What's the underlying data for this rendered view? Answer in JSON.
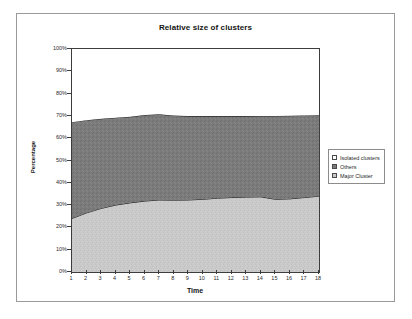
{
  "chart_data": {
    "type": "area",
    "stacked": true,
    "percent_stacked": true,
    "title": "Relative size of clusters",
    "xlabel": "Time",
    "ylabel": "Percentage",
    "grid": false,
    "legend_position": "right",
    "xlim": [
      1,
      18
    ],
    "ylim": [
      0,
      100
    ],
    "x": [
      1,
      2,
      3,
      4,
      5,
      6,
      7,
      8,
      9,
      10,
      11,
      12,
      13,
      14,
      15,
      16,
      17,
      18
    ],
    "categories": [
      "1",
      "2",
      "3",
      "4",
      "5",
      "6",
      "7",
      "8",
      "9",
      "10",
      "11",
      "12",
      "13",
      "14",
      "15",
      "16",
      "17",
      "18"
    ],
    "xtick_labels": [
      "1",
      "2",
      "3",
      "4",
      "5",
      "6",
      "7",
      "8",
      "9",
      "10",
      "11",
      "12",
      "13",
      "14",
      "15",
      "16",
      "17",
      "18"
    ],
    "ytick_labels": [
      "0%",
      "10%",
      "20%",
      "30%",
      "40%",
      "50%",
      "60%",
      "70%",
      "80%",
      "90%",
      "100%"
    ],
    "ytick_values": [
      0,
      10,
      20,
      30,
      40,
      50,
      60,
      70,
      80,
      90,
      100
    ],
    "series": [
      {
        "name": "Major Cluster",
        "color": "#c9c9c9",
        "stack_order": 1,
        "values": [
          24,
          26.5,
          28.5,
          30,
          31,
          31.8,
          32.3,
          32.2,
          32.3,
          32.6,
          33.1,
          33.4,
          33.6,
          33.7,
          32.6,
          32.8,
          33.4,
          34.0
        ]
      },
      {
        "name": "Others",
        "color": "#7b7b7b",
        "stack_order": 2,
        "values": [
          43.2,
          41.6,
          40.2,
          39.2,
          38.6,
          38.6,
          38.4,
          38.0,
          37.6,
          37.3,
          36.8,
          36.5,
          36.3,
          36.3,
          37.4,
          37.3,
          36.8,
          36.3
        ]
      },
      {
        "name": "Isolated clusters",
        "color": "#ffffff",
        "stack_order": 3,
        "values": [
          32.8,
          31.9,
          31.3,
          30.8,
          30.4,
          29.6,
          29.3,
          29.8,
          30.1,
          30.1,
          30.1,
          30.1,
          30.1,
          30.0,
          30.0,
          29.9,
          29.8,
          29.7
        ]
      }
    ],
    "cumulative_boundaries": {
      "major_cluster_top": [
        24,
        26.5,
        28.5,
        30,
        31,
        31.8,
        32.3,
        32.2,
        32.3,
        32.6,
        33.1,
        33.4,
        33.6,
        33.7,
        32.6,
        32.8,
        33.4,
        34.0
      ],
      "others_top": [
        67.2,
        68.1,
        68.7,
        69.2,
        69.6,
        70.4,
        70.7,
        70.2,
        69.9,
        69.9,
        69.9,
        69.9,
        69.9,
        70.0,
        70.0,
        70.1,
        70.2,
        70.3
      ]
    }
  },
  "legend": {
    "items": [
      {
        "label": "Isolated clusters",
        "color": "#ffffff"
      },
      {
        "label": "Others",
        "color": "#7b7b7b"
      },
      {
        "label": "Major Cluster",
        "color": "#c9c9c9"
      }
    ]
  }
}
